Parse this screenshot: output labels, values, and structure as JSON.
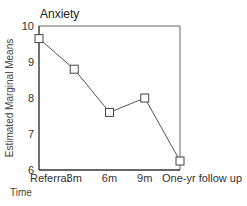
{
  "chart_data": {
    "type": "line",
    "title": "Anxiety",
    "xlabel": "Time",
    "ylabel": "Estimated Marginal Means",
    "categories": [
      "Referral",
      "3m",
      "6m",
      "9m",
      "One-yr follow up"
    ],
    "series": [
      {
        "name": "Anxiety",
        "values": [
          9.65,
          8.8,
          7.6,
          8.0,
          6.25
        ],
        "marker": "square"
      }
    ],
    "ylim": [
      6,
      10
    ],
    "yticks": [
      6,
      7,
      8,
      9,
      10
    ],
    "grid": false,
    "legend": "none",
    "frame": "box"
  },
  "colors": {
    "line": "#555555",
    "axis": "#333333",
    "frame": "#555555"
  }
}
